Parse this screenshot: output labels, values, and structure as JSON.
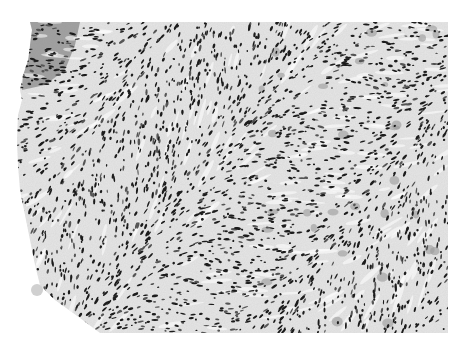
{
  "image": {
    "kind": "histology-micrograph",
    "stain_appearance": "grayscale",
    "background_color": "#ffffff",
    "tissue_base_color": "#e6e6e6",
    "stroma_color": "#cfcfcf",
    "nucleus_color": "#1c1c1c",
    "nucleus_color_light": "#555555",
    "pale_cell_color": "#9a9a9a",
    "tissue_bounds": {
      "left": 17,
      "top": 22,
      "right": 448,
      "bottom": 333
    },
    "tissue_outline": [
      [
        30,
        22
      ],
      [
        448,
        22
      ],
      [
        448,
        333
      ],
      [
        100,
        333
      ],
      [
        80,
        318
      ],
      [
        55,
        300
      ],
      [
        40,
        285
      ],
      [
        35,
        265
      ],
      [
        30,
        240
      ],
      [
        25,
        215
      ],
      [
        20,
        190
      ],
      [
        18,
        165
      ],
      [
        17,
        140
      ],
      [
        18,
        115
      ],
      [
        22,
        100
      ],
      [
        20,
        90
      ],
      [
        23,
        75
      ],
      [
        28,
        60
      ],
      [
        30,
        45
      ],
      [
        32,
        30
      ]
    ],
    "dark_edge_region": [
      [
        30,
        22
      ],
      [
        80,
        22
      ],
      [
        75,
        45
      ],
      [
        65,
        70
      ],
      [
        45,
        85
      ],
      [
        22,
        90
      ],
      [
        23,
        75
      ],
      [
        28,
        60
      ],
      [
        30,
        45
      ]
    ],
    "debris_spot": {
      "cx": 37,
      "cy": 290,
      "r": 6,
      "color": "#d0d0d0"
    },
    "nuclei": {
      "count": 2600,
      "seed": 7,
      "min_len": 2,
      "max_len": 7,
      "min_w": 1.2,
      "max_w": 2.6
    }
  }
}
